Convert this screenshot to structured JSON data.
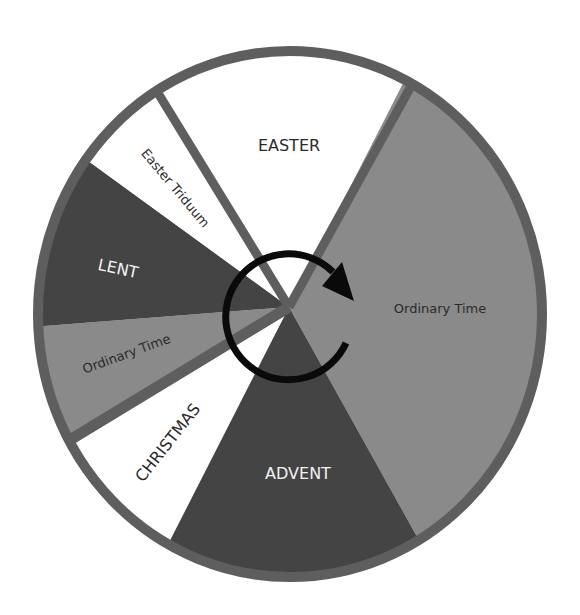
{
  "diagram": {
    "colors": {
      "rim": "#5e5e5e",
      "divider": "#5e5e5e",
      "white_season": "#ffffff",
      "dark_season": "#444444",
      "gray_season": "#8a8a8a",
      "arrow": "#0a0a0a",
      "label_dark": "#2a2a2a",
      "label_light": "#f2f2f2"
    },
    "segments": [
      {
        "id": "easter",
        "label": "EASTER",
        "fill": "white"
      },
      {
        "id": "ordinary-time-summer",
        "label": "Ordinary Time",
        "fill": "gray"
      },
      {
        "id": "advent",
        "label": "ADVENT",
        "fill": "dark"
      },
      {
        "id": "christmas",
        "label": "CHRISTMAS",
        "fill": "white"
      },
      {
        "id": "ordinary-time-winter",
        "label": "Ordinary Time",
        "fill": "gray"
      },
      {
        "id": "lent",
        "label": "LENT",
        "fill": "dark"
      },
      {
        "id": "easter-triduum",
        "label": "Easter Triduum",
        "fill": "white"
      }
    ],
    "arrow": {
      "direction": "clockwise",
      "icon": "circular-arrow-icon"
    }
  }
}
